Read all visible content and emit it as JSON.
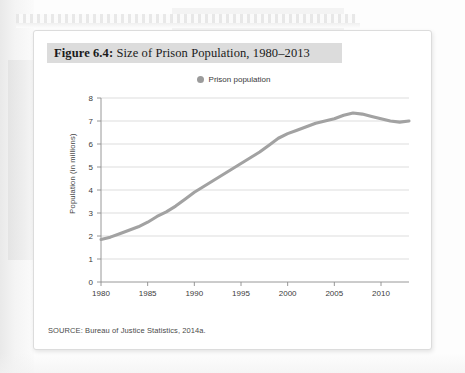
{
  "figure": {
    "title_prefix": "Figure 6.4:",
    "title_rest": " Size of Prison Population, 1980–2013",
    "source": "SOURCE: Bureau of Justice Statistics, 2014a."
  },
  "legend": {
    "marker_color": "#9b9b9b",
    "label": "Prison population"
  },
  "chart_data": {
    "type": "line",
    "title": "Figure 6.4: Size of Prison Population, 1980–2013",
    "xlabel": "",
    "ylabel": "Population (in millions)",
    "xlim": [
      1980,
      2013
    ],
    "ylim": [
      0,
      8
    ],
    "grid": true,
    "legend_position": "top-center",
    "xticks": [
      1980,
      1985,
      1990,
      1995,
      2000,
      2005,
      2010
    ],
    "yticks": [
      0,
      1,
      2,
      3,
      4,
      5,
      6,
      7,
      8
    ],
    "line_color": "#a2a2a2",
    "series": [
      {
        "name": "Prison population",
        "x": [
          1980,
          1981,
          1982,
          1983,
          1984,
          1985,
          1986,
          1987,
          1988,
          1989,
          1990,
          1991,
          1992,
          1993,
          1994,
          1995,
          1996,
          1997,
          1998,
          1999,
          2000,
          2001,
          2002,
          2003,
          2004,
          2005,
          2006,
          2007,
          2008,
          2009,
          2010,
          2011,
          2012,
          2013
        ],
        "values": [
          1.85,
          1.95,
          2.1,
          2.25,
          2.4,
          2.6,
          2.85,
          3.05,
          3.3,
          3.6,
          3.9,
          4.15,
          4.4,
          4.65,
          4.9,
          5.15,
          5.4,
          5.65,
          5.95,
          6.25,
          6.45,
          6.6,
          6.75,
          6.9,
          7.0,
          7.1,
          7.25,
          7.35,
          7.3,
          7.2,
          7.1,
          7.0,
          6.95,
          7.0
        ]
      }
    ]
  },
  "axes": {
    "y_title": "Population (in millions)"
  }
}
